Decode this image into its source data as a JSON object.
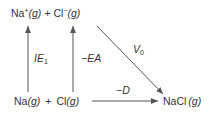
{
  "diagram": {
    "type": "thermochemical-cycle",
    "nodes": {
      "top": {
        "species1": "Na",
        "charge1": "+",
        "state1": "(g)",
        "plus": "+",
        "species2": "Cl",
        "charge2": "−",
        "state2": "(g)"
      },
      "bottom_left": {
        "species1": "Na",
        "state1": "(g)",
        "plus": "+",
        "species2": "Cl",
        "state2": "(g)"
      },
      "bottom_right": {
        "species": "NaCl",
        "state": "(g)"
      }
    },
    "arrows": {
      "ionization": {
        "label_main": "IE",
        "label_sub": "1",
        "direction": "up"
      },
      "electron_affinity": {
        "label": "−EA",
        "direction": "up"
      },
      "coulomb": {
        "label_main": "V",
        "label_sub": "0",
        "direction": "down-right"
      },
      "dissociation": {
        "label": "−D",
        "direction": "right"
      }
    },
    "colors": {
      "stroke": "#555555",
      "text": "#333333"
    }
  }
}
